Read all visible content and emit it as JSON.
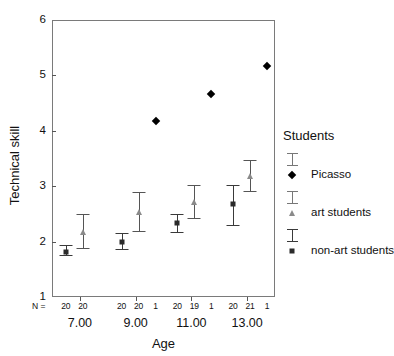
{
  "chart_data": {
    "type": "scatter",
    "title": "",
    "xlabel": "Age",
    "ylabel": "Technical skill",
    "ylim": [
      1,
      6
    ],
    "y_ticks": [
      1,
      2,
      3,
      4,
      5,
      6
    ],
    "grid": false,
    "legend_position": "right",
    "legend_title": "Students",
    "categories": [
      "7.00",
      "9.00",
      "11.00",
      "13.00"
    ],
    "n_label": "N =",
    "series": [
      {
        "name": "non-art students",
        "marker": "square",
        "color": "#2b2b2b",
        "values": [
          1.82,
          2.0,
          2.33,
          2.67
        ],
        "error_low": [
          1.75,
          1.86,
          2.17,
          2.3
        ],
        "error_high": [
          1.93,
          2.16,
          2.5,
          3.03
        ],
        "n": [
          20,
          20,
          20,
          20
        ]
      },
      {
        "name": "art students",
        "marker": "triangle",
        "color": "#8a8a8a",
        "values": [
          2.17,
          2.54,
          2.71,
          3.18
        ],
        "error_low": [
          1.88,
          2.19,
          2.43,
          2.91
        ],
        "error_high": [
          2.5,
          2.9,
          3.03,
          3.47
        ],
        "n": [
          20,
          20,
          19,
          21
        ]
      },
      {
        "name": "Picasso",
        "marker": "diamond",
        "color": "#000000",
        "values": [
          null,
          4.18,
          4.67,
          5.17
        ],
        "n": [
          null,
          1,
          1,
          1
        ]
      }
    ]
  },
  "axes": {
    "y_title": "Technical skill",
    "x_title": "Age",
    "y_tick_labels": [
      "1",
      "2",
      "3",
      "4",
      "5",
      "6"
    ],
    "x_tick_labels": [
      "7.00",
      "9.00",
      "11.00",
      "13.00"
    ]
  },
  "n_row": {
    "prefix": "N =",
    "groups": [
      [
        "20",
        "20"
      ],
      [
        "20",
        "20",
        "1"
      ],
      [
        "20",
        "19",
        "1"
      ],
      [
        "20",
        "21",
        "1"
      ]
    ]
  },
  "legend": {
    "title": "Students",
    "entries": [
      {
        "label": "Picasso",
        "marker": "diamond",
        "color": "#000000"
      },
      {
        "label": "art students",
        "marker": "triangle",
        "color": "#8a8a8a"
      },
      {
        "label": "non-art students",
        "marker": "square",
        "color": "#2b2b2b"
      }
    ]
  }
}
